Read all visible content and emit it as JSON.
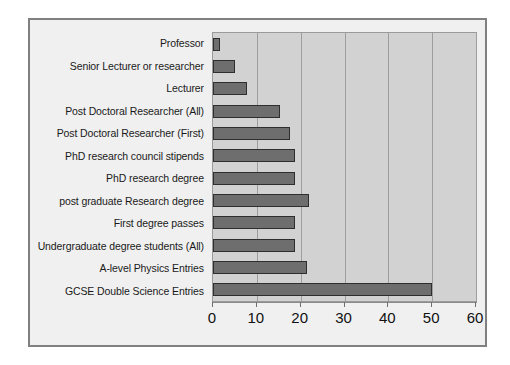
{
  "chart_data": {
    "type": "bar",
    "orientation": "horizontal",
    "title": "",
    "subtitle": "",
    "xlabel": "",
    "ylabel": "",
    "xlim": [
      0,
      60
    ],
    "xticks": [
      0,
      10,
      20,
      30,
      40,
      50,
      60
    ],
    "xtick_labels": [
      "0",
      "10",
      "20",
      "30",
      "40",
      "50",
      "60"
    ],
    "grid": true,
    "grid_axis": "x",
    "legend": false,
    "legend_position": "none",
    "categories": [
      "Professor",
      "Senior Lecturer or researcher",
      "Lecturer",
      "Post Doctoral Researcher (All)",
      "Post Doctoral Researcher (First)",
      "PhD research council stipends",
      "PhD research degree",
      "post graduate Research degree",
      "First degree passes",
      "Undergraduate degree students (All)",
      "A-level Physics Entries",
      "GCSE Double Science Entries"
    ],
    "values": [
      1.5,
      5,
      7.7,
      15.3,
      17.5,
      18.6,
      18.6,
      21.8,
      18.8,
      18.6,
      21.4,
      50
    ],
    "bar_fill_color": "#6e6e6e",
    "bar_border_color": "#2e2e2e",
    "plot_background_color": "#d2d2d2",
    "figure_background_color": "#f0f0f0",
    "gridline_color": "#9e9e9e"
  }
}
